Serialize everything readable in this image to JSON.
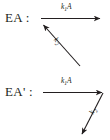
{
  "figure": {
    "background_color": "#ffffff",
    "ink_color": "#231f20",
    "rows": [
      {
        "species_label": "EA :",
        "arrows": [
          {
            "name": "forward-arrow",
            "direction": "right",
            "rate_label": "k",
            "rate_subscript": "1",
            "rate_suffix": "A",
            "rate_full": "k1A"
          },
          {
            "name": "reverse-arrow",
            "direction": "up-left",
            "rate_label": "k",
            "rate_subscript": "2",
            "rate_suffix": "",
            "rate_full": "k2"
          }
        ]
      },
      {
        "species_label": "EA' :",
        "arrows": [
          {
            "name": "forward-arrow",
            "direction": "right",
            "rate_label": "k",
            "rate_subscript": "1",
            "rate_suffix": "A",
            "rate_full": "k1A"
          },
          {
            "name": "exit-arrow",
            "direction": "down-left",
            "rate_label": "k",
            "rate_subscript": "2",
            "rate_suffix": "",
            "rate_full": "k2"
          }
        ]
      }
    ]
  }
}
